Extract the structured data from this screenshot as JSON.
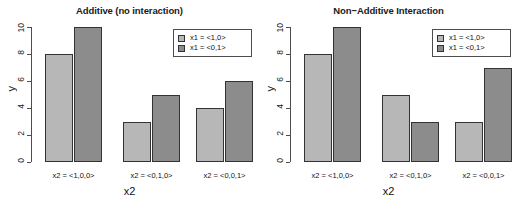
{
  "figure": {
    "background": "#ffffff",
    "colors": {
      "bar_light": "#b7b7b7",
      "bar_dark": "#8c8c8c",
      "bar_border": "#333333",
      "axis": "#4d4d4d",
      "text": "#111111"
    }
  },
  "chart_data": [
    {
      "type": "bar",
      "title": "Additive (no interaction)",
      "xlabel": "x2",
      "ylabel": "y",
      "ylim": [
        0,
        10
      ],
      "yticks": [
        0,
        2,
        4,
        6,
        8,
        10
      ],
      "ytick_labels": [
        "0",
        "2",
        "4",
        "6",
        "8",
        "10"
      ],
      "grid": false,
      "legend_position": "top-right",
      "categories": [
        "x2 = <1,0,0>",
        "x2 = <0,1,0>",
        "x2 = <0,0,1>"
      ],
      "series": [
        {
          "name": "x1 = <1,0>",
          "color": "#b7b7b7",
          "values": [
            8,
            3,
            4
          ]
        },
        {
          "name": "x1 = <0,1>",
          "color": "#8c8c8c",
          "values": [
            10,
            5,
            6
          ]
        }
      ]
    },
    {
      "type": "bar",
      "title": "Non−Additive Interaction",
      "xlabel": "x2",
      "ylabel": "y",
      "ylim": [
        0,
        10
      ],
      "yticks": [
        0,
        2,
        4,
        6,
        8,
        10
      ],
      "ytick_labels": [
        "0",
        "2",
        "4",
        "6",
        "8",
        "10"
      ],
      "grid": false,
      "legend_position": "top-right",
      "categories": [
        "x2 = <1,0,0>",
        "x2 = <0,1,0>",
        "x2 = <0,0,1>"
      ],
      "series": [
        {
          "name": "x1 = <1,0>",
          "color": "#b7b7b7",
          "values": [
            8,
            5,
            3
          ]
        },
        {
          "name": "x1 = <0,1>",
          "color": "#8c8c8c",
          "values": [
            10,
            3,
            7
          ]
        }
      ]
    }
  ]
}
